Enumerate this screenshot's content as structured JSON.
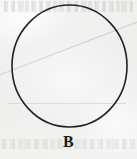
{
  "figure": {
    "kind": "geometric-figure",
    "shape_name": "circle",
    "label": "B",
    "caption_position": "below",
    "background_color": "#f1f1f0",
    "stroke_color": "#222222",
    "stroke_width_px": 1.6,
    "fill": "none",
    "center_x": 69.5,
    "center_y": 66,
    "radius_x": 57.5,
    "radius_y": 61,
    "artifacts": {
      "paper_texture": "light-gray-scan-grain",
      "ghost_text_top": "faint bleed-through text line",
      "ghost_text_bottom": "faint bleed-through text line",
      "ghost_diagonal": "faint diagonal show-through streak",
      "ghost_rule": "faint horizontal show-through rule"
    }
  }
}
